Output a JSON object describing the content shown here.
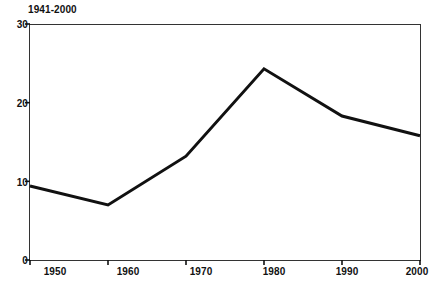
{
  "chart_data": {
    "type": "line",
    "title": "1941-2000",
    "xlabel": "",
    "ylabel": "",
    "x": [
      1950,
      1960,
      1970,
      1980,
      1990,
      2000
    ],
    "categories": [
      "1950",
      "1960",
      "1970",
      "1980",
      "1990",
      "2000"
    ],
    "values": [
      9.4,
      7.0,
      13.2,
      24.3,
      18.3,
      15.8
    ],
    "series": [
      {
        "name": "1941-2000",
        "values": [
          9.4,
          7.0,
          13.2,
          24.3,
          18.3,
          15.8
        ]
      }
    ],
    "xlim": [
      1950,
      2000
    ],
    "ylim": [
      0,
      30
    ],
    "yticks": [
      0,
      10,
      20,
      30
    ],
    "ytick_labels": [
      "0",
      "10",
      "20",
      "30"
    ],
    "xticks": [
      1950,
      1960,
      1970,
      1980,
      1990,
      2000
    ],
    "xtick_labels": [
      "1950",
      "1960",
      "1970",
      "1980",
      "1990",
      "2000"
    ],
    "grid": false,
    "legend": false,
    "legend_position": "none",
    "line_color": "#111111",
    "frame_color": "#333333",
    "background_color": "#ffffff"
  },
  "axes": {
    "y_labels": [
      "30",
      "20",
      "10",
      "0"
    ],
    "x_labels": [
      "1950",
      "1960",
      "1970",
      "1980",
      "1990",
      "2000"
    ]
  },
  "title": "1941-2000"
}
